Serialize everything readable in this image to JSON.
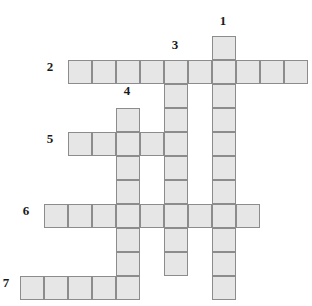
{
  "puzzle": {
    "title": "Crossword Grid",
    "grid": {
      "cell_size": 24,
      "origin_x": 20,
      "origin_y": 36,
      "fill_color": "#e6e6e6",
      "border_color": "#8c8c8c",
      "background_color": "#ffffff"
    },
    "entries": [
      {
        "number": "1",
        "direction": "down",
        "length": 11,
        "start_col": 8,
        "start_row": 0,
        "label_x": 215,
        "label_y": 14
      },
      {
        "number": "2",
        "direction": "across",
        "length": 10,
        "start_col": 2,
        "start_row": 1,
        "label_x": 42,
        "label_y": 60
      },
      {
        "number": "3",
        "direction": "down",
        "length": 9,
        "start_col": 6,
        "start_row": 1,
        "label_x": 167,
        "label_y": 38
      },
      {
        "number": "4",
        "direction": "down",
        "length": 8,
        "start_col": 4,
        "start_row": 3,
        "label_x": 119,
        "label_y": 84
      },
      {
        "number": "5",
        "direction": "across",
        "length": 5,
        "start_col": 2,
        "start_row": 4,
        "label_x": 42,
        "label_y": 132
      },
      {
        "number": "6",
        "direction": "across",
        "length": 9,
        "start_col": 1,
        "start_row": 7,
        "label_x": 18,
        "label_y": 204
      },
      {
        "number": "7",
        "direction": "across",
        "length": 6,
        "start_col": 0,
        "start_row": 10,
        "label_x": -2,
        "label_y": 276
      }
    ],
    "cells": [
      {
        "col": 8,
        "row": 0
      },
      {
        "col": 8,
        "row": 1
      },
      {
        "col": 8,
        "row": 2
      },
      {
        "col": 8,
        "row": 3
      },
      {
        "col": 8,
        "row": 4
      },
      {
        "col": 8,
        "row": 5
      },
      {
        "col": 8,
        "row": 6
      },
      {
        "col": 8,
        "row": 7
      },
      {
        "col": 8,
        "row": 8
      },
      {
        "col": 8,
        "row": 9
      },
      {
        "col": 8,
        "row": 10
      },
      {
        "col": 2,
        "row": 1
      },
      {
        "col": 3,
        "row": 1
      },
      {
        "col": 4,
        "row": 1
      },
      {
        "col": 5,
        "row": 1
      },
      {
        "col": 6,
        "row": 1
      },
      {
        "col": 7,
        "row": 1
      },
      {
        "col": 9,
        "row": 1
      },
      {
        "col": 10,
        "row": 1
      },
      {
        "col": 11,
        "row": 1
      },
      {
        "col": 6,
        "row": 2
      },
      {
        "col": 6,
        "row": 3
      },
      {
        "col": 6,
        "row": 4
      },
      {
        "col": 6,
        "row": 5
      },
      {
        "col": 6,
        "row": 6
      },
      {
        "col": 6,
        "row": 7
      },
      {
        "col": 6,
        "row": 8
      },
      {
        "col": 6,
        "row": 9
      },
      {
        "col": 4,
        "row": 3
      },
      {
        "col": 4,
        "row": 4
      },
      {
        "col": 4,
        "row": 5
      },
      {
        "col": 4,
        "row": 6
      },
      {
        "col": 4,
        "row": 7
      },
      {
        "col": 4,
        "row": 8
      },
      {
        "col": 4,
        "row": 9
      },
      {
        "col": 4,
        "row": 10
      },
      {
        "col": 2,
        "row": 4
      },
      {
        "col": 3,
        "row": 4
      },
      {
        "col": 5,
        "row": 4
      },
      {
        "col": 1,
        "row": 7
      },
      {
        "col": 2,
        "row": 7
      },
      {
        "col": 3,
        "row": 7
      },
      {
        "col": 5,
        "row": 7
      },
      {
        "col": 7,
        "row": 7
      },
      {
        "col": 9,
        "row": 7
      },
      {
        "col": 0,
        "row": 10
      },
      {
        "col": 1,
        "row": 10
      },
      {
        "col": 2,
        "row": 10
      },
      {
        "col": 3,
        "row": 10
      }
    ]
  }
}
